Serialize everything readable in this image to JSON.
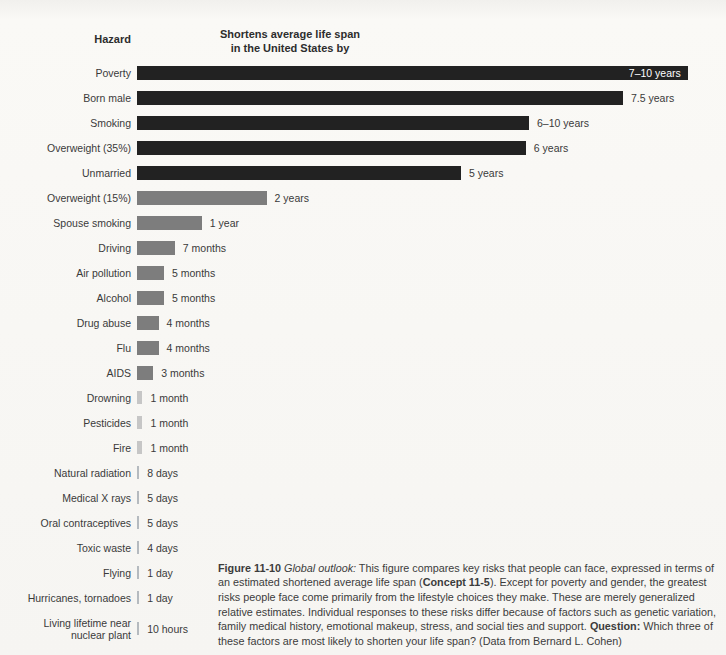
{
  "header": {
    "hazard_label": "Hazard",
    "span_label_line1": "Shortens average life span",
    "span_label_line2": "in the United States by"
  },
  "colors": {
    "dark": "#222222",
    "gray": "#7d7d7d",
    "light": "#c6c6c6",
    "thin": "#b5babf",
    "inside_label_text": "#ffffff",
    "label_text": "#3a3a3a"
  },
  "chart_data": {
    "type": "bar",
    "orientation": "horizontal",
    "title": "Shortens average life span in the United States by",
    "xlabel": "Hazard",
    "legend": "none",
    "grid": false,
    "categories": [
      "Poverty",
      "Born male",
      "Smoking",
      "Overweight (35%)",
      "Unmarried",
      "Overweight (15%)",
      "Spouse smoking",
      "Driving",
      "Air pollution",
      "Alcohol",
      "Drug abuse",
      "Flu",
      "AIDS",
      "Drowning",
      "Pesticides",
      "Fire",
      "Natural radiation",
      "Medical X rays",
      "Oral contraceptives",
      "Toxic waste",
      "Flying",
      "Hurricanes, tornadoes",
      [
        "Living lifetime near",
        "nuclear plant"
      ]
    ],
    "value_labels": [
      "7–10 years",
      "7.5 years",
      "6–10 years",
      "6 years",
      "5 years",
      "2 years",
      "1 year",
      "7 months",
      "5 months",
      "5 months",
      "4 months",
      "4 months",
      "3 months",
      "1 month",
      "1 month",
      "1 month",
      "8 days",
      "5 days",
      "5 days",
      "4 days",
      "1 day",
      "1 day",
      "10 hours"
    ],
    "values_years": [
      8.5,
      7.5,
      6.05,
      6.0,
      5.0,
      2.0,
      1.0,
      0.5833,
      0.4167,
      0.4167,
      0.3333,
      0.3333,
      0.25,
      0.0833,
      0.0833,
      0.0833,
      0.0219,
      0.0137,
      0.0137,
      0.011,
      0.0027,
      0.0027,
      0.00114
    ],
    "bar_styles": [
      "dark",
      "dark",
      "dark",
      "dark",
      "dark",
      "gray",
      "gray",
      "gray",
      "gray",
      "gray",
      "gray",
      "gray",
      "gray",
      "light",
      "light",
      "light",
      "thin",
      "thin",
      "thin",
      "thin",
      "thin",
      "thin",
      "thin"
    ],
    "px_per_year": 64.8,
    "min_bar_px": 2.2,
    "first_label_inside": true
  },
  "caption": {
    "segments": [
      {
        "text": "Figure 11-10",
        "bold": true
      },
      {
        "text": " "
      },
      {
        "text": "Global outlook:",
        "italic": true
      },
      {
        "text": "  This figure compares key risks that people can face, expressed in terms of an estimated shortened average life span ("
      },
      {
        "text": "Concept 11-5",
        "bold": true
      },
      {
        "text": "). Except for poverty and gender, the greatest risks people face come primarily from the lifestyle choices they make. These are merely generalized relative estimates. Individual responses to these risks differ because of factors such as genetic variation, family medical history, emotional makeup, stress, and social ties and support. "
      },
      {
        "text": "Question:",
        "bold": true
      },
      {
        "text": " Which three of these factors are most likely to shorten your life span? (Data from Bernard L. Cohen)"
      }
    ]
  }
}
